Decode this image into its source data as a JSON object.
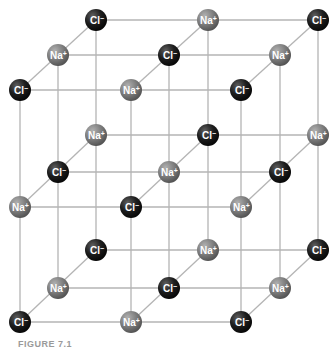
{
  "diagram": {
    "ions": {
      "Na": {
        "symbol": "Na",
        "charge": "+",
        "color": "#7a7a7a",
        "highlight": "#a8a8a8"
      },
      "Cl": {
        "symbol": "Cl",
        "charge": "−",
        "color": "#1a1a1a",
        "highlight": "#5a5a5a"
      }
    },
    "layers": [
      {
        "name": "back",
        "x": [
          96,
          208,
          318
        ],
        "y": [
          20,
          135,
          250
        ],
        "rows": [
          [
            "Cl",
            "Na",
            "Cl"
          ],
          [
            "Na",
            "Cl",
            "Na"
          ],
          [
            "Cl",
            "Na",
            "Cl"
          ]
        ]
      },
      {
        "name": "middle",
        "x": [
          58,
          169,
          280
        ],
        "y": [
          55,
          172,
          288
        ],
        "rows": [
          [
            "Na",
            "Cl",
            "Na"
          ],
          [
            "Cl",
            "Na",
            "Cl"
          ],
          [
            "Na",
            "Cl",
            "Na"
          ]
        ]
      },
      {
        "name": "front",
        "x": [
          20,
          131,
          241
        ],
        "y": [
          90,
          207,
          322
        ],
        "rows": [
          [
            "Cl",
            "Na",
            "Cl"
          ],
          [
            "Na",
            "Cl",
            "Na"
          ],
          [
            "Cl",
            "Na",
            "Cl"
          ]
        ]
      }
    ],
    "atom_radius": 11,
    "bond_color": "#b4b4b4"
  },
  "caption": "FIGURE 7.1"
}
